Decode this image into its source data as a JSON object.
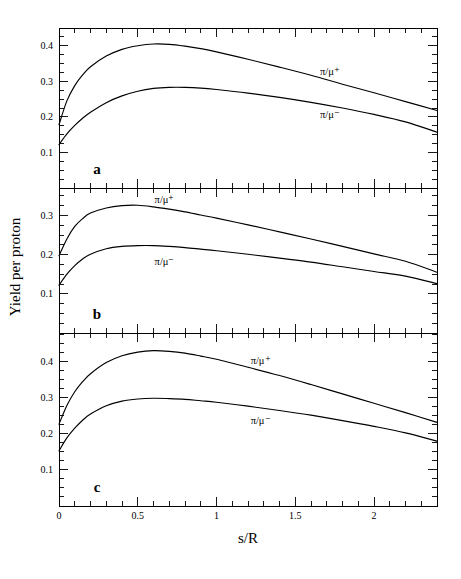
{
  "figure": {
    "xlabel": "s/R",
    "ylabel": "Yield per proton",
    "panel_letters": [
      "a",
      "b",
      "c"
    ]
  },
  "chart_data": {
    "type": "line",
    "title": "",
    "xlabel": "s/R",
    "ylabel": "Yield per proton",
    "xlim": [
      0,
      2.4
    ],
    "xticks": [
      0,
      0.5,
      1,
      1.5,
      2
    ],
    "xtick_labels": [
      "0",
      "0.5",
      "1",
      "1.5",
      "2"
    ],
    "grid": false,
    "legend": "inline-curve-labels",
    "panels": [
      {
        "letter": "a",
        "ylim": [
          0,
          0.45
        ],
        "yticks": [
          0.1,
          0.2,
          0.3,
          0.4
        ],
        "ytick_labels": [
          "0.1",
          "0.2",
          "0.3",
          "0.4"
        ],
        "series": [
          {
            "name": "pi/mu+",
            "label": "π/μ⁺",
            "label_x": 1.72,
            "label_y": 0.318,
            "x": [
              0,
              0.05,
              0.1,
              0.15,
              0.2,
              0.3,
              0.4,
              0.5,
              0.6,
              0.7,
              0.8,
              0.9,
              1.0,
              1.2,
              1.4,
              1.6,
              1.8,
              2.0,
              2.2,
              2.4
            ],
            "y": [
              0.178,
              0.245,
              0.288,
              0.318,
              0.341,
              0.371,
              0.39,
              0.4,
              0.405,
              0.404,
              0.399,
              0.392,
              0.383,
              0.362,
              0.34,
              0.317,
              0.292,
              0.268,
              0.243,
              0.218
            ]
          },
          {
            "name": "pi/mu-",
            "label": "π/μ⁻",
            "label_x": 1.72,
            "label_y": 0.198,
            "x": [
              0,
              0.05,
              0.1,
              0.15,
              0.2,
              0.3,
              0.4,
              0.5,
              0.6,
              0.7,
              0.8,
              0.9,
              1.0,
              1.2,
              1.4,
              1.6,
              1.8,
              2.0,
              2.2,
              2.4
            ],
            "y": [
              0.122,
              0.152,
              0.176,
              0.196,
              0.213,
              0.24,
              0.259,
              0.272,
              0.28,
              0.283,
              0.283,
              0.281,
              0.277,
              0.267,
              0.255,
              0.241,
              0.225,
              0.207,
              0.186,
              0.157
            ]
          }
        ]
      },
      {
        "letter": "b",
        "ylim": [
          0,
          0.37
        ],
        "yticks": [
          0.1,
          0.2,
          0.3
        ],
        "ytick_labels": [
          "0.1",
          "0.2",
          "0.3"
        ],
        "series": [
          {
            "name": "pi/mu+",
            "label": "π/μ⁺",
            "label_x": 0.67,
            "label_y": 0.333,
            "x": [
              0,
              0.05,
              0.1,
              0.15,
              0.2,
              0.3,
              0.4,
              0.5,
              0.6,
              0.7,
              0.8,
              0.9,
              1.0,
              1.2,
              1.4,
              1.6,
              1.8,
              2.0,
              2.2,
              2.4
            ],
            "y": [
              0.197,
              0.24,
              0.272,
              0.292,
              0.306,
              0.319,
              0.325,
              0.326,
              0.322,
              0.316,
              0.309,
              0.301,
              0.293,
              0.276,
              0.258,
              0.24,
              0.221,
              0.202,
              0.183,
              0.155
            ]
          },
          {
            "name": "pi/mu-",
            "label": "π/μ⁻",
            "label_x": 0.67,
            "label_y": 0.174,
            "x": [
              0,
              0.05,
              0.1,
              0.15,
              0.2,
              0.3,
              0.4,
              0.5,
              0.6,
              0.7,
              0.8,
              0.9,
              1.0,
              1.2,
              1.4,
              1.6,
              1.8,
              2.0,
              2.2,
              2.4
            ],
            "y": [
              0.122,
              0.15,
              0.172,
              0.189,
              0.201,
              0.215,
              0.221,
              0.223,
              0.223,
              0.221,
              0.218,
              0.214,
              0.21,
              0.201,
              0.191,
              0.181,
              0.169,
              0.157,
              0.145,
              0.126
            ]
          }
        ]
      },
      {
        "letter": "c",
        "ylim": [
          0,
          0.48
        ],
        "yticks": [
          0.1,
          0.2,
          0.3,
          0.4
        ],
        "ytick_labels": [
          "0.1",
          "0.2",
          "0.3",
          "0.4"
        ],
        "series": [
          {
            "name": "pi/mu+",
            "label": "π/μ⁺",
            "label_x": 1.28,
            "label_y": 0.395,
            "x": [
              0,
              0.05,
              0.1,
              0.15,
              0.2,
              0.3,
              0.4,
              0.5,
              0.6,
              0.7,
              0.8,
              0.9,
              1.0,
              1.2,
              1.4,
              1.6,
              1.8,
              2.0,
              2.2,
              2.4
            ],
            "y": [
              0.227,
              0.279,
              0.317,
              0.345,
              0.367,
              0.398,
              0.417,
              0.427,
              0.431,
              0.429,
              0.424,
              0.416,
              0.407,
              0.385,
              0.362,
              0.337,
              0.311,
              0.285,
              0.259,
              0.232
            ]
          },
          {
            "name": "pi/mu-",
            "label": "π/μ⁻",
            "label_x": 1.28,
            "label_y": 0.228,
            "x": [
              0,
              0.05,
              0.1,
              0.15,
              0.2,
              0.3,
              0.4,
              0.5,
              0.6,
              0.7,
              0.8,
              0.9,
              1.0,
              1.2,
              1.4,
              1.6,
              1.8,
              2.0,
              2.2,
              2.4
            ],
            "y": [
              0.153,
              0.189,
              0.216,
              0.238,
              0.255,
              0.278,
              0.291,
              0.297,
              0.299,
              0.298,
              0.296,
              0.292,
              0.288,
              0.277,
              0.265,
              0.252,
              0.237,
              0.221,
              0.203,
              0.18
            ]
          }
        ]
      }
    ]
  }
}
